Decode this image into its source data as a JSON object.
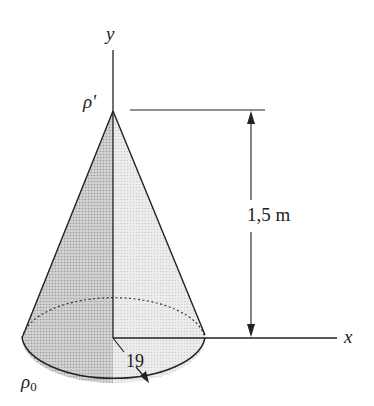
{
  "figure": {
    "type": "cone-diagram",
    "axes": {
      "y_label": "y",
      "x_label": "x"
    },
    "apex_label": "ρ'",
    "base_label": "ρ",
    "base_label_sub": "0",
    "height_dimension": "1,5 m",
    "radius_dimension": "19",
    "colors": {
      "ink": "#222222",
      "shade_dark": "#bdbdbd",
      "shade_light": "#e2e2e2",
      "background": "#ffffff"
    }
  }
}
